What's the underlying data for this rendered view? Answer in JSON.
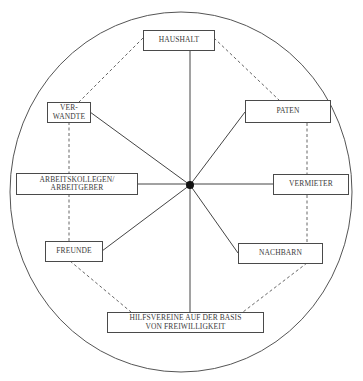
{
  "diagram": {
    "type": "network-diagram",
    "center": {
      "label": "",
      "x": 190,
      "y": 185
    },
    "colors": {
      "line": "#3a3a3a",
      "text": "#3a3a3a",
      "background": "#ffffff"
    },
    "nodes": [
      {
        "id": "haushalt",
        "lines": [
          "HAUSHALT"
        ]
      },
      {
        "id": "paten",
        "lines": [
          "PATEN"
        ]
      },
      {
        "id": "vermieter",
        "lines": [
          "VERMIETER"
        ]
      },
      {
        "id": "nachbarn",
        "lines": [
          "NACHBARN"
        ]
      },
      {
        "id": "hilfsvereine",
        "lines": [
          "HILFSVEREINE AUF DER BASIS",
          "VON FREIWILLIGKEIT"
        ]
      },
      {
        "id": "freunde",
        "lines": [
          "FREUNDE"
        ]
      },
      {
        "id": "arbeitskollegen",
        "lines": [
          "ARBEITSKOLLEGEN/",
          "ARBEITGEBER"
        ]
      },
      {
        "id": "verwandte",
        "lines": [
          "VER-",
          "WANDTE"
        ]
      }
    ],
    "solid_edges": "each node connected to center hub",
    "dashed_edges": [
      [
        "haushalt",
        "paten"
      ],
      [
        "paten",
        "vermieter"
      ],
      [
        "vermieter",
        "nachbarn"
      ],
      [
        "nachbarn",
        "hilfsvereine"
      ],
      [
        "hilfsvereine",
        "freunde"
      ],
      [
        "freunde",
        "arbeitskollegen"
      ],
      [
        "arbeitskollegen",
        "verwandte"
      ],
      [
        "verwandte",
        "haushalt"
      ]
    ]
  }
}
